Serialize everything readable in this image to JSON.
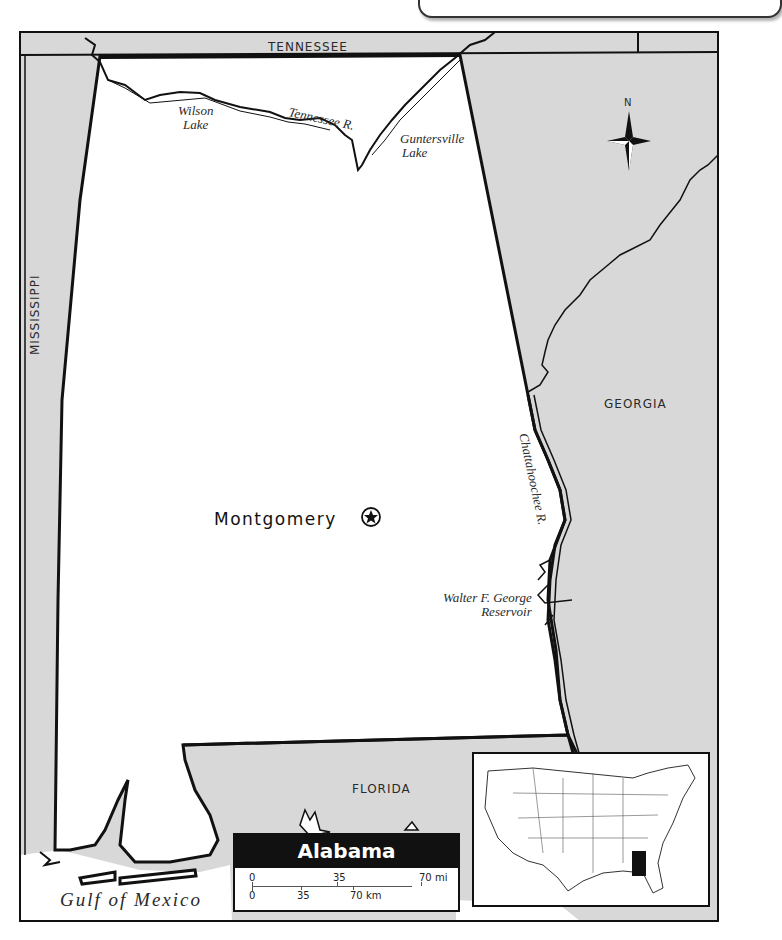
{
  "map": {
    "title": "Alabama",
    "states": {
      "tennessee": "TENNESSEE",
      "mississippi": "MISSISSIPPI",
      "georgia": "GEORGIA",
      "florida": "FLORIDA"
    },
    "water": {
      "wilson_lake": [
        "Wilson",
        "Lake"
      ],
      "tennessee_river": "Tennessee R.",
      "guntersville_lake": [
        "Guntersville",
        "Lake"
      ],
      "chattahoochee_river": "Chattahoochee R.",
      "walter_f_george": [
        "Walter F. George",
        "Reservoir"
      ],
      "gulf": "Gulf of Mexico"
    },
    "capital": {
      "name": "Montgomery",
      "symbol": "star-in-circle"
    },
    "compass": {
      "label": "N"
    },
    "scale": {
      "miles": {
        "labels": [
          "0",
          "35",
          "70 mi"
        ]
      },
      "km": {
        "labels": [
          "0",
          "35",
          "70 km"
        ]
      }
    },
    "locator": {
      "description": "United States locator map",
      "highlighted_state": "Alabama",
      "highlight_color": "#111111"
    },
    "colors": {
      "neighbor_fill": "#d8d8d8",
      "state_fill": "#ffffff",
      "border": "#111111"
    }
  }
}
